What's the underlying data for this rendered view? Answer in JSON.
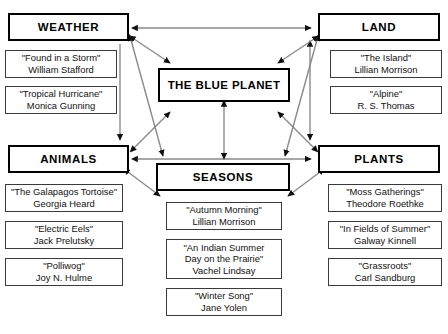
{
  "diagram": {
    "title": "THE BLUE PLANET",
    "center": {
      "label": "THE BLUE PLANET",
      "x": 158,
      "y": 68,
      "w": 132,
      "h": 34
    },
    "categories": [
      {
        "key": "weather",
        "label": "WEATHER",
        "box": {
          "x": 8,
          "y": 13,
          "w": 121,
          "h": 28
        },
        "poems": [
          {
            "title": "\"Found in a Storm\"",
            "author": "William Stafford",
            "box": {
              "x": 5,
              "y": 50,
              "w": 112,
              "h": 28
            }
          },
          {
            "title": "\"Tropical Hurricane\"",
            "author": "Monica Gunning",
            "box": {
              "x": 5,
              "y": 86,
              "w": 112,
              "h": 28
            }
          }
        ]
      },
      {
        "key": "land",
        "label": "LAND",
        "box": {
          "x": 318,
          "y": 13,
          "w": 122,
          "h": 28
        },
        "poems": [
          {
            "title": "\"The Island\"",
            "author": "Lillian Morrison",
            "box": {
              "x": 330,
              "y": 50,
              "w": 112,
              "h": 28
            }
          },
          {
            "title": "\"Alpine\"",
            "author": "R. S. Thomas",
            "box": {
              "x": 330,
              "y": 86,
              "w": 112,
              "h": 28
            }
          }
        ]
      },
      {
        "key": "animals",
        "label": "ANIMALS",
        "box": {
          "x": 8,
          "y": 145,
          "w": 121,
          "h": 28
        },
        "poems": [
          {
            "title": "\"The Galapagos Tortoise\"",
            "author": "Georgia Heard",
            "box": {
              "x": 5,
              "y": 184,
              "w": 118,
              "h": 28
            }
          },
          {
            "title": "\"Electric Eels\"",
            "author": "Jack Prelutsky",
            "box": {
              "x": 5,
              "y": 221,
              "w": 118,
              "h": 28
            }
          },
          {
            "title": "\"Polliwog\"",
            "author": "Joy N. Hulme",
            "box": {
              "x": 5,
              "y": 258,
              "w": 118,
              "h": 28
            }
          }
        ]
      },
      {
        "key": "plants",
        "label": "PLANTS",
        "box": {
          "x": 318,
          "y": 145,
          "w": 122,
          "h": 28
        },
        "poems": [
          {
            "title": "\"Moss Gatherings\"",
            "author": "Theodore Roethke",
            "box": {
              "x": 328,
              "y": 184,
              "w": 114,
              "h": 28
            }
          },
          {
            "title": "\"In Fields of Summer\"",
            "author": "Galway Kinnell",
            "box": {
              "x": 328,
              "y": 221,
              "w": 114,
              "h": 28
            }
          },
          {
            "title": "\"Grassroots\"",
            "author": "Carl Sandburg",
            "box": {
              "x": 328,
              "y": 258,
              "w": 114,
              "h": 28
            }
          }
        ]
      },
      {
        "key": "seasons",
        "label": "SEASONS",
        "box": {
          "x": 156,
          "y": 163,
          "w": 134,
          "h": 28
        },
        "poems": [
          {
            "title": "\"Autumn Morning\"",
            "author": "Lillian Morrison",
            "box": {
              "x": 166,
              "y": 202,
              "w": 116,
              "h": 28
            }
          },
          {
            "title": "\"An Indian Summer",
            "title2": "Day on the Prairie\"",
            "author": "Vachel Lindsay",
            "box": {
              "x": 166,
              "y": 239,
              "w": 116,
              "h": 40
            }
          },
          {
            "title": "\"Winter Song\"",
            "author": "Jane Yolen",
            "box": {
              "x": 166,
              "y": 288,
              "w": 116,
              "h": 28
            }
          }
        ]
      }
    ],
    "colors": {
      "line": "#8a8a8a",
      "border": "#000000",
      "poem_border": "#3a3a3a",
      "text": "#000000",
      "background": "#ffffff"
    },
    "connector_labels": {
      "weather_land": "weather-to-land-double-arrow",
      "animals_plants": "animals-to-plants-double-arrow",
      "weather_animals": "weather-to-animals-arrow",
      "land_plants": "land-to-plants-double-arrow",
      "center_seasons": "center-to-seasons-double-arrow",
      "weather_center": "weather-to-center-double-arrow",
      "land_center": "land-to-center-double-arrow",
      "animals_center": "animals-to-center-double-arrow",
      "plants_center": "plants-to-center-double-arrow",
      "weather_seasons": "weather-to-seasons-diagonal",
      "land_seasons": "land-to-seasons-diagonal",
      "animals_seasons": "animals-to-seasons-diagonal",
      "plants_seasons": "plants-to-seasons-diagonal"
    }
  }
}
